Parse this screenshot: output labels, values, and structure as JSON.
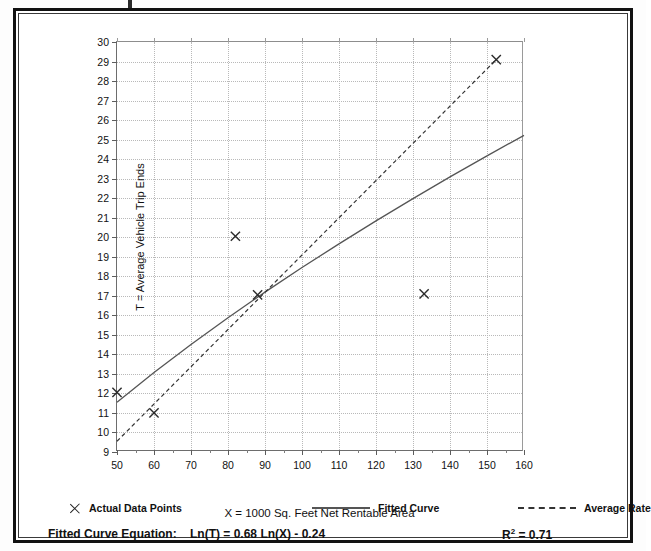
{
  "figure": {
    "y_axis_title": "T = Average Vehicle Trip Ends",
    "x_axis_title": "X = 1000 Sq. Feet Net Rentable Area"
  },
  "legend": {
    "points_label": "Actual Data Points",
    "fitted_label": "Fitted Curve",
    "average_label": "Average Rate"
  },
  "footer": {
    "equation_label": "Fitted Curve Equation:",
    "equation": "Ln(T) = 0.68 Ln(X) - 0.24",
    "r2_prefix": "R",
    "r2_exp": "2",
    "r2_value": "= 0.71"
  },
  "chart_data": {
    "type": "scatter",
    "title": "",
    "xlabel": "X = 1000 Sq. Feet Net Rentable Area",
    "ylabel": "T = Average Vehicle Trip Ends",
    "xlim": [
      50,
      160
    ],
    "ylim": [
      9,
      30
    ],
    "xticks": [
      50,
      60,
      70,
      80,
      90,
      100,
      110,
      120,
      130,
      140,
      150,
      160
    ],
    "yticks": [
      9,
      10,
      11,
      12,
      13,
      14,
      15,
      16,
      17,
      18,
      19,
      20,
      21,
      22,
      23,
      24,
      25,
      26,
      27,
      28,
      29,
      30
    ],
    "x_minor_step": 5,
    "grid": true,
    "legend_position": "below-axis",
    "series": [
      {
        "name": "Actual Data Points",
        "type": "scatter",
        "marker": "x",
        "color": "#333333",
        "points": [
          {
            "x": 50.0,
            "y": 12.05
          },
          {
            "x": 60.0,
            "y": 11.0
          },
          {
            "x": 82.0,
            "y": 20.05
          },
          {
            "x": 88.0,
            "y": 17.05
          },
          {
            "x": 133.0,
            "y": 17.1
          },
          {
            "x": 152.5,
            "y": 29.1
          }
        ]
      },
      {
        "name": "Fitted Curve",
        "type": "line",
        "style": "solid",
        "color": "#555555",
        "equation": "Ln(T) = 0.68 Ln(X) - 0.24",
        "points": [
          {
            "x": 50,
            "y": 11.55
          },
          {
            "x": 60,
            "y": 13.07
          },
          {
            "x": 70,
            "y": 14.51
          },
          {
            "x": 80,
            "y": 15.88
          },
          {
            "x": 88,
            "y": 16.93
          },
          {
            "x": 90,
            "y": 17.19
          },
          {
            "x": 100,
            "y": 18.45
          },
          {
            "x": 110,
            "y": 19.66
          },
          {
            "x": 120,
            "y": 20.84
          },
          {
            "x": 130,
            "y": 21.98
          },
          {
            "x": 140,
            "y": 23.09
          },
          {
            "x": 150,
            "y": 24.17
          },
          {
            "x": 160,
            "y": 25.22
          }
        ]
      },
      {
        "name": "Average Rate",
        "type": "line",
        "style": "dashed",
        "color": "#333333",
        "points": [
          {
            "x": 50,
            "y": 9.55
          },
          {
            "x": 88,
            "y": 16.8
          },
          {
            "x": 152.5,
            "y": 29.1
          }
        ]
      }
    ]
  }
}
